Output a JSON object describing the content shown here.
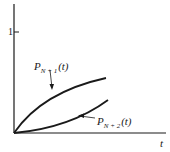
{
  "figure": {
    "y_tick_label": "1",
    "x_axis_label": "t",
    "curves": [
      {
        "name": "P_{N+1}(t)",
        "label_main": "P",
        "label_sub": "N + 1",
        "label_arg": "(t)",
        "shape": "concave increasing from origin"
      },
      {
        "name": "P_{N+2}(t)",
        "label_main": "P",
        "label_sub": "N + 2",
        "label_arg": "(t)",
        "shape": "convex increasing from origin"
      }
    ],
    "colors": {
      "ink": "#1a1a1a",
      "background": "#ffffff"
    }
  }
}
